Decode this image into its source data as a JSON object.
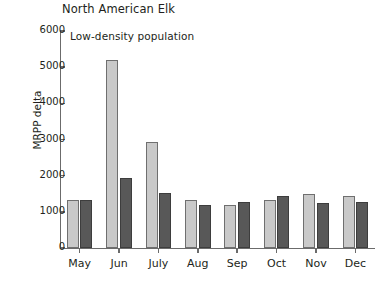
{
  "chart_data": {
    "type": "bar",
    "title": "North American Elk",
    "subtitle": "Low-density population",
    "xlabel": "",
    "ylabel": "MRPP delta",
    "ylim": [
      0,
      6000
    ],
    "yticks": [
      0,
      1000,
      2000,
      3000,
      4000,
      5000,
      6000
    ],
    "ytick_labels": [
      "0",
      "1000",
      "2000",
      "3000",
      "4000",
      "5000",
      "6000"
    ],
    "grid": false,
    "legend": "none",
    "categories": [
      "May",
      "Jun",
      "July",
      "Aug",
      "Sep",
      "Oct",
      "Nov",
      "Dec"
    ],
    "series": [
      {
        "name": "light-gray-series",
        "color": "#c9c9c9",
        "values": [
          1320,
          5200,
          2930,
          1330,
          1190,
          1340,
          1480,
          1450
        ]
      },
      {
        "name": "dark-gray-series",
        "color": "#585858",
        "values": [
          1320,
          1930,
          1530,
          1190,
          1260,
          1440,
          1240,
          1270
        ]
      }
    ]
  },
  "axis": {
    "y_title": "MRPP delta"
  }
}
